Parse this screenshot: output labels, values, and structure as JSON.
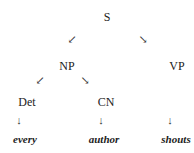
{
  "tree": {
    "root": "S",
    "np": "NP",
    "vp": "VP",
    "det": "Det",
    "cn": "CN",
    "words": [
      "every",
      "author",
      "shouts"
    ],
    "arrows": {
      "down_left": "↙",
      "down_right": "↘",
      "down": "↓"
    }
  }
}
